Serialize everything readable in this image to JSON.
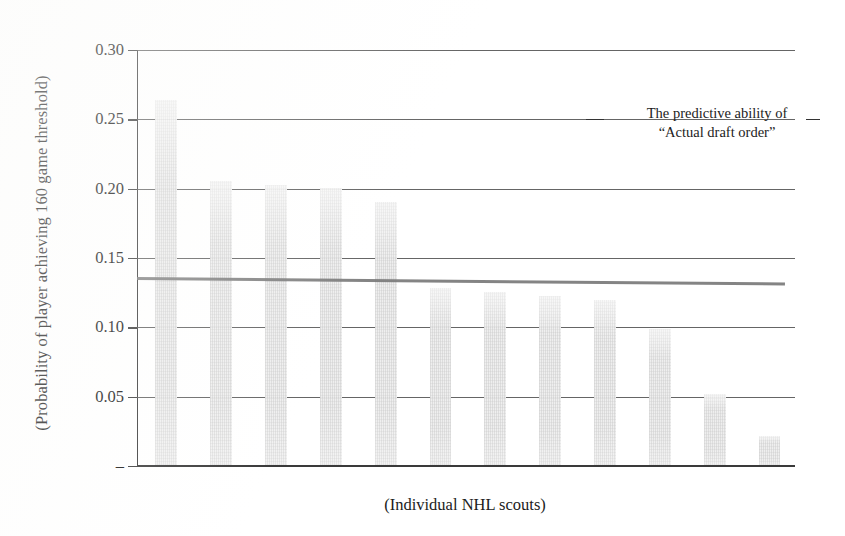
{
  "figure": {
    "background_color": "#ffffff",
    "bar_color": "#e3e3e3",
    "grid_color": "#545454",
    "axis_color": "#3a3a3a",
    "trendline_color": "#7a7a7a"
  },
  "annotation": {
    "line1": "The predictive ability of",
    "line2": "“Actual draft order”",
    "dash_left": "",
    "dash_right": ""
  },
  "chart_data": {
    "type": "bar",
    "title": "",
    "subtitle": "",
    "xlabel": "(Individual NHL scouts)",
    "ylabel": "(Probability of player achieving 160 game threshold)",
    "ylim": [
      0.0,
      0.3
    ],
    "ytick_values": [
      0.0,
      0.05,
      0.1,
      0.15,
      0.2,
      0.25,
      0.3
    ],
    "ytick_labels": [
      "–",
      "0.05",
      "0.10",
      "0.15",
      "0.20",
      "0.25",
      "0.30"
    ],
    "grid": true,
    "grid_axis": "y",
    "legend": false,
    "categories": [
      "Scout 1",
      "Scout 2",
      "Scout 3",
      "Scout 4",
      "Scout 5",
      "Scout 6",
      "Scout 7",
      "Scout 8",
      "Scout 9",
      "Scout 10",
      "Scout 11",
      "Scout 12"
    ],
    "values": [
      0.263,
      0.205,
      0.202,
      0.2,
      0.19,
      0.128,
      0.125,
      0.122,
      0.119,
      0.098,
      0.051,
      0.021
    ],
    "series": [
      {
        "name": "Individual scout predictive ability",
        "values": [
          0.263,
          0.205,
          0.202,
          0.2,
          0.19,
          0.128,
          0.125,
          0.122,
          0.119,
          0.098,
          0.051,
          0.021
        ]
      }
    ],
    "reference_line": {
      "name": "The predictive ability of “Actual draft order”",
      "type": "horizontal-trend",
      "y_start": 0.136,
      "y_end": 0.132,
      "x_start_fraction": 0.0,
      "x_end_fraction": 0.985
    }
  }
}
